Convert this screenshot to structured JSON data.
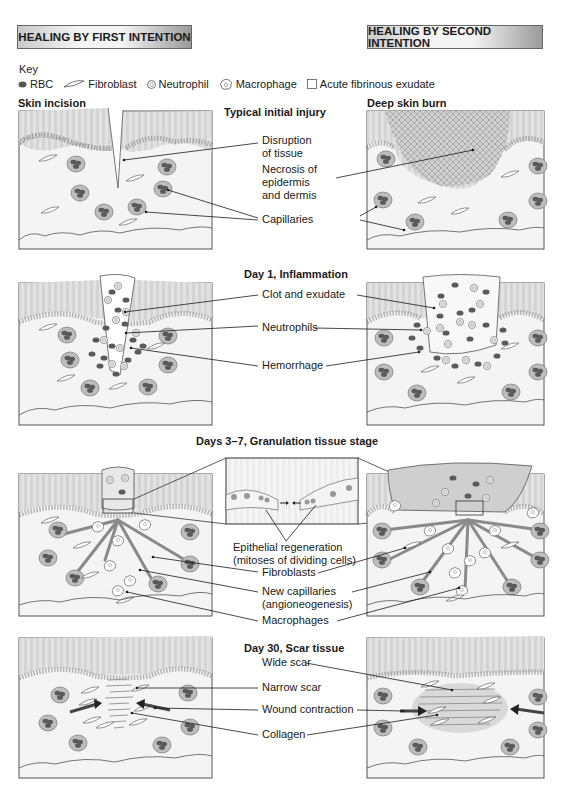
{
  "headers": {
    "left": "HEALING BY FIRST INTENTION",
    "right": "HEALING BY SECOND INTENTION"
  },
  "key": {
    "title": "Key",
    "items": [
      {
        "icon": "rbc-icon",
        "label": "RBC"
      },
      {
        "icon": "fibroblast-icon",
        "label": "Fibroblast"
      },
      {
        "icon": "neutrophil-icon",
        "label": "Neutrophil"
      },
      {
        "icon": "macrophage-icon",
        "label": "Macrophage"
      },
      {
        "icon": "exudate-icon",
        "label": "Acute fibrinous exudate"
      }
    ]
  },
  "panel_titles": {
    "left": "Skin incision",
    "right": "Deep skin burn"
  },
  "stages": [
    {
      "title": "Typical initial injury",
      "labels": [
        "Disruption\nof tissue",
        "Necrosis of\nepidermis\nand dermis",
        "Capillaries"
      ]
    },
    {
      "title": "Day 1, Inflammation",
      "labels": [
        "Clot and exudate",
        "Neutrophils",
        "Hemorrhage"
      ]
    },
    {
      "title": "Days 3–7, Granulation tissue stage",
      "labels": [
        "Epithelial regeneration\n(mitoses of dividing cells)",
        "Fibroblasts",
        "New capillaries\n(angioneogenesis)",
        "Macrophages"
      ]
    },
    {
      "title": "Day 30, Scar tissue",
      "labels": [
        "Wide scar",
        "Narrow scar",
        "Wound contraction",
        "Collagen"
      ]
    }
  ],
  "colors": {
    "tissue": "#f2f2f2",
    "epidermis": "#dcdcdc",
    "rbc": "#5a5a5a",
    "capillary": "#b5b5b5",
    "line": "#1a1a1a"
  }
}
